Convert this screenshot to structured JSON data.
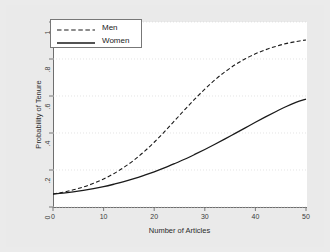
{
  "chart_data": {
    "type": "line",
    "title": "",
    "xlabel": "Number of Articles",
    "ylabel": "Probability of Tenure",
    "xlim": [
      0,
      50
    ],
    "ylim": [
      0,
      1
    ],
    "grid": true,
    "grid_axis": "y",
    "legend_position": "top-left",
    "xticks": [
      "0",
      "10",
      "20",
      "30",
      "40",
      "50"
    ],
    "xtick_values": [
      0,
      10,
      20,
      30,
      40,
      50
    ],
    "yticks": [
      "0",
      ".2",
      ".4",
      ".6",
      ".8",
      "1"
    ],
    "ytick_values": [
      0,
      0.2,
      0.4,
      0.6,
      0.8,
      1
    ],
    "x": [
      0,
      2,
      4,
      6,
      8,
      10,
      12,
      14,
      16,
      18,
      20,
      22,
      24,
      26,
      28,
      30,
      32,
      34,
      36,
      38,
      40,
      42,
      44,
      46,
      48,
      50
    ],
    "series": [
      {
        "name": "Men",
        "style": "dashed",
        "color": "#1a1a1a",
        "values": [
          0.07,
          0.08,
          0.093,
          0.108,
          0.128,
          0.152,
          0.18,
          0.214,
          0.253,
          0.299,
          0.35,
          0.406,
          0.465,
          0.525,
          0.583,
          0.637,
          0.687,
          0.731,
          0.769,
          0.801,
          0.828,
          0.85,
          0.868,
          0.883,
          0.894,
          0.903
        ]
      },
      {
        "name": "Women",
        "style": "solid",
        "color": "#1a1a1a",
        "values": [
          0.07,
          0.075,
          0.082,
          0.09,
          0.099,
          0.11,
          0.123,
          0.137,
          0.153,
          0.171,
          0.19,
          0.211,
          0.234,
          0.258,
          0.284,
          0.311,
          0.339,
          0.368,
          0.398,
          0.428,
          0.458,
          0.487,
          0.515,
          0.542,
          0.565,
          0.583
        ]
      }
    ]
  },
  "legend": {
    "entries": [
      {
        "label": "Men",
        "style": "dashed"
      },
      {
        "label": "Women",
        "style": "solid"
      }
    ]
  },
  "axes": {
    "x_title": "Number of Articles",
    "y_title": "Probability of Tenure",
    "x_tick_labels": [
      "0",
      "10",
      "20",
      "30",
      "40",
      "50"
    ],
    "y_tick_labels": [
      "1",
      ".8",
      ".6",
      ".4",
      ".2",
      "0"
    ]
  },
  "colors": {
    "background": "#ebebeb",
    "plot_background": "#ffffff",
    "axis": "#6e6e6e",
    "grid": "#d9d9d9",
    "line": "#1a1a1a",
    "text": "#2b2b2b"
  }
}
